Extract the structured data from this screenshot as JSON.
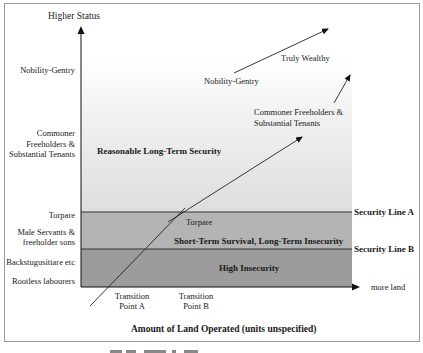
{
  "diagram": {
    "y_axis": {
      "title": "Higher Status",
      "levels": [
        {
          "label": "Nobility-Gentry"
        },
        {
          "label_lines": [
            "Commoner",
            "Freeholders &",
            "Substantial Tenants"
          ]
        },
        {
          "label": "Torpare"
        },
        {
          "label_lines": [
            "Male Servants &",
            "freeholder sons"
          ]
        },
        {
          "label": "Backstugusittare etc"
        },
        {
          "label": "Rootless labourers"
        }
      ]
    },
    "x_axis": {
      "title": "Amount of Land Operated (units unspecified)",
      "end_label": "more land",
      "ticks": [
        {
          "label_lines": [
            "Transition",
            "Point A"
          ]
        },
        {
          "label_lines": [
            "Transition",
            "Point B"
          ]
        }
      ]
    },
    "zones": [
      {
        "label": "Reasonable Long-Term Security",
        "color": "#e6e6e6"
      },
      {
        "label": "Short-Term Survival, Long-Term Insecurity",
        "color": "#b3b3b3"
      },
      {
        "label": "High Insecurity",
        "color": "#999999"
      }
    ],
    "security_lines": [
      {
        "label": "Security Line A"
      },
      {
        "label": "Security Line B"
      }
    ],
    "path_labels": {
      "torpare": "Torpare",
      "commoner_lines": [
        "Commoner Freeholders &",
        "Substantial Tenants"
      ],
      "nobility": "Nobility-Gentry",
      "truly_wealthy": "Truly Wealthy"
    }
  },
  "caption": "Figure caption (cut off)"
}
